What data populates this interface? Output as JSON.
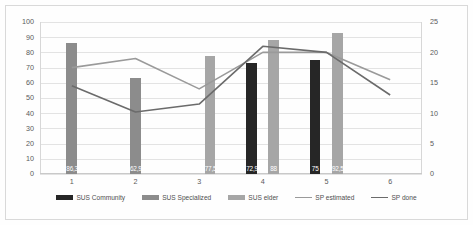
{
  "chart_data": {
    "type": "bar",
    "title": "",
    "subtitle": "",
    "xlabel": "",
    "ylabel": "",
    "categories": [
      "1",
      "2",
      "3",
      "4",
      "5",
      "6"
    ],
    "grid": true,
    "legend_position": "bottom",
    "axes": {
      "left": {
        "min": 0,
        "max": 100,
        "step": 10,
        "ticks": [
          "0",
          "10",
          "20",
          "30",
          "40",
          "50",
          "60",
          "70",
          "80",
          "90",
          "100"
        ]
      },
      "right": {
        "min": 0,
        "max": 25,
        "step": 5,
        "ticks": [
          "0",
          "5",
          "10",
          "15",
          "20",
          "25"
        ]
      }
    },
    "series": [
      {
        "name": "SUS Community",
        "kind": "bar",
        "axis": "left",
        "color": "#262626",
        "values": [
          null,
          null,
          null,
          72.9,
          75,
          null
        ],
        "labels": [
          "",
          "",
          "",
          "72,9",
          "75",
          ""
        ]
      },
      {
        "name": "SUS Specialized",
        "kind": "bar",
        "axis": "left",
        "color": "#8c8c8c",
        "values": [
          86.3,
          62.9,
          null,
          null,
          null,
          null
        ],
        "labels": [
          "86,3",
          "62,9",
          "",
          "",
          "",
          ""
        ]
      },
      {
        "name": "SUS elder",
        "kind": "bar",
        "axis": "left",
        "color": "#a6a6a6",
        "values": [
          null,
          null,
          77.5,
          88,
          92.5,
          null
        ],
        "labels": [
          "",
          "",
          "77,5",
          "88",
          "92,5",
          ""
        ]
      },
      {
        "name": "SP estimated",
        "kind": "line",
        "axis": "right",
        "color": "#9a9a9a",
        "values": [
          17.5,
          19.0,
          14.0,
          20.0,
          20.0,
          15.5
        ]
      },
      {
        "name": "SP done",
        "kind": "line",
        "axis": "right",
        "color": "#6b6b6b",
        "values": [
          14.5,
          10.2,
          11.5,
          21.0,
          20.0,
          13.0
        ]
      }
    ]
  },
  "legend": {
    "items": [
      {
        "label": "SUS Community",
        "color": "#262626",
        "kind": "bar"
      },
      {
        "label": "SUS Specialized",
        "color": "#8c8c8c",
        "kind": "bar"
      },
      {
        "label": "SUS elder",
        "color": "#a6a6a6",
        "kind": "bar"
      },
      {
        "label": "SP estimated",
        "color": "#9a9a9a",
        "kind": "line"
      },
      {
        "label": "SP done",
        "color": "#6b6b6b",
        "kind": "line"
      }
    ]
  }
}
